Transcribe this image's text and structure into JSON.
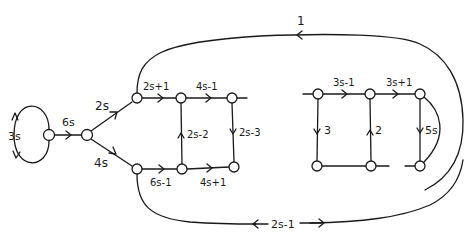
{
  "diagram": {
    "type": "signal-flow-graph",
    "edge_color": "#1a1a1a",
    "background": "#ffffff",
    "labels": {
      "self_loop": "3s",
      "input_branch": "6s",
      "upper_branch": "2s",
      "lower_branch": "4s",
      "top_left_1": "2s+1",
      "top_left_2": "4s-1",
      "mid_up": "2s-2",
      "mid_down": "2s-3",
      "bottom_left_1": "6s-1",
      "bottom_left_2": "4s+1",
      "top_right_1": "3s-1",
      "top_right_2": "3s+1",
      "right_down_1": "3",
      "right_up_2": "2",
      "right_down_3": "5s",
      "outer_top": "1",
      "outer_bottom": "2s-1"
    },
    "nodes": [
      {
        "id": "n0",
        "x": 49,
        "y": 135
      },
      {
        "id": "n1",
        "x": 87,
        "y": 135
      },
      {
        "id": "n2",
        "x": 137,
        "y": 98
      },
      {
        "id": "n3",
        "x": 181,
        "y": 98
      },
      {
        "id": "n4",
        "x": 232,
        "y": 98
      },
      {
        "id": "n5",
        "x": 137,
        "y": 169
      },
      {
        "id": "n6",
        "x": 182,
        "y": 169
      },
      {
        "id": "n7",
        "x": 234,
        "y": 167
      },
      {
        "id": "n8",
        "x": 318,
        "y": 94
      },
      {
        "id": "n9",
        "x": 370,
        "y": 94
      },
      {
        "id": "n10",
        "x": 420,
        "y": 94
      },
      {
        "id": "n11",
        "x": 317,
        "y": 166
      },
      {
        "id": "n12",
        "x": 371,
        "y": 166
      },
      {
        "id": "n13",
        "x": 420,
        "y": 166
      }
    ]
  }
}
